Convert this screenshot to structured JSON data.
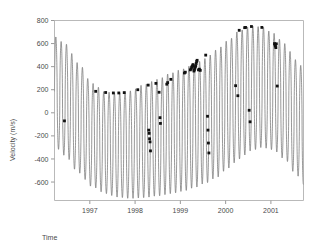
{
  "chart_data": {
    "type": "line",
    "title": "",
    "subtitle": "",
    "xlabel": "Time",
    "ylabel": "Velocity (m/s)",
    "xlim": [
      1996.22,
      2001.72
    ],
    "ylim": [
      -760,
      800
    ],
    "grid": false,
    "legend": null,
    "x_tick_labels": [
      "1997",
      "1998",
      "1999",
      "2000",
      "2001"
    ],
    "x_tick_values": [
      1997,
      1998,
      1999,
      2000,
      2001
    ],
    "y_tick_labels": [
      "800",
      "600",
      "400",
      "200",
      "0",
      "-200",
      "-400",
      "-600"
    ],
    "y_tick_values": [
      800,
      600,
      400,
      200,
      0,
      -200,
      -400,
      -600
    ],
    "series": [
      {
        "name": "model-velocity-curve",
        "kind": "line",
        "color": "#6b6b6b",
        "description": "High-frequency periodic radial velocity model with slowly varying envelope",
        "period_years": 0.1176,
        "envelope_upper_x": [
          1996.22,
          1996.45,
          1996.75,
          1997.05,
          1997.35,
          1997.6,
          1997.9,
          1998.2,
          1998.5,
          1998.8,
          1999.05,
          1999.3,
          1999.55,
          1999.8,
          2000.05,
          2000.3,
          2000.55,
          2000.8,
          2001.05,
          2001.3,
          2001.55,
          2001.72
        ],
        "envelope_upper_y": [
          660,
          600,
          430,
          255,
          180,
          172,
          190,
          245,
          290,
          345,
          380,
          420,
          470,
          545,
          625,
          710,
          752,
          745,
          690,
          600,
          460,
          390
        ],
        "envelope_lower_x": [
          1996.22,
          1996.45,
          1996.75,
          1997.05,
          1997.35,
          1997.6,
          1997.9,
          1998.2,
          1998.5,
          1998.8,
          1999.05,
          1999.3,
          1999.55,
          1999.8,
          2000.05,
          2000.3,
          2000.55,
          2000.8,
          2001.05,
          2001.3,
          2001.55,
          2001.72
        ],
        "envelope_lower_y": [
          -290,
          -370,
          -520,
          -640,
          -700,
          -730,
          -742,
          -735,
          -720,
          -700,
          -680,
          -650,
          -610,
          -560,
          -480,
          -400,
          -330,
          -300,
          -320,
          -400,
          -530,
          -620
        ]
      },
      {
        "name": "observed-data-points",
        "kind": "scatter",
        "color": "#111111",
        "marker": "square",
        "points": [
          {
            "x": 1996.44,
            "y": -70
          },
          {
            "x": 1997.13,
            "y": 186
          },
          {
            "x": 1997.35,
            "y": 176
          },
          {
            "x": 1997.52,
            "y": 172
          },
          {
            "x": 1997.64,
            "y": 172
          },
          {
            "x": 1997.76,
            "y": 175
          },
          {
            "x": 1998.06,
            "y": 200
          },
          {
            "x": 1998.29,
            "y": 240
          },
          {
            "x": 1998.3,
            "y": -150
          },
          {
            "x": 1998.31,
            "y": -178
          },
          {
            "x": 1998.32,
            "y": -225
          },
          {
            "x": 1998.33,
            "y": -252
          },
          {
            "x": 1998.34,
            "y": -330
          },
          {
            "x": 1998.46,
            "y": 255
          },
          {
            "x": 1998.53,
            "y": 178
          },
          {
            "x": 1998.55,
            "y": -42
          },
          {
            "x": 1998.56,
            "y": -92
          },
          {
            "x": 1998.7,
            "y": 248
          },
          {
            "x": 1998.72,
            "y": 262
          },
          {
            "x": 1998.79,
            "y": 290
          },
          {
            "x": 1999.09,
            "y": 345
          },
          {
            "x": 1999.11,
            "y": 352
          },
          {
            "x": 1999.22,
            "y": 372
          },
          {
            "x": 1999.24,
            "y": 380
          },
          {
            "x": 1999.25,
            "y": 395
          },
          {
            "x": 1999.26,
            "y": 400
          },
          {
            "x": 1999.27,
            "y": 408
          },
          {
            "x": 1999.28,
            "y": 418
          },
          {
            "x": 1999.3,
            "y": 362
          },
          {
            "x": 1999.31,
            "y": 372
          },
          {
            "x": 1999.32,
            "y": 386
          },
          {
            "x": 1999.33,
            "y": 398
          },
          {
            "x": 1999.34,
            "y": 408
          },
          {
            "x": 1999.35,
            "y": 428
          },
          {
            "x": 1999.36,
            "y": 445
          },
          {
            "x": 1999.37,
            "y": 455
          },
          {
            "x": 1999.4,
            "y": 372
          },
          {
            "x": 1999.42,
            "y": 378
          },
          {
            "x": 1999.44,
            "y": 368
          },
          {
            "x": 1999.56,
            "y": 500
          },
          {
            "x": 1999.6,
            "y": -30
          },
          {
            "x": 1999.61,
            "y": -150
          },
          {
            "x": 1999.62,
            "y": -262
          },
          {
            "x": 1999.63,
            "y": -348
          },
          {
            "x": 2000.22,
            "y": 235
          },
          {
            "x": 2000.27,
            "y": 148
          },
          {
            "x": 2000.3,
            "y": 715
          },
          {
            "x": 2000.42,
            "y": 738
          },
          {
            "x": 2000.44,
            "y": 740
          },
          {
            "x": 2000.52,
            "y": 22
          },
          {
            "x": 2000.54,
            "y": -78
          },
          {
            "x": 2000.57,
            "y": 748
          },
          {
            "x": 2000.8,
            "y": 740
          },
          {
            "x": 2001.08,
            "y": 600
          },
          {
            "x": 2001.09,
            "y": 588
          },
          {
            "x": 2001.1,
            "y": 578
          },
          {
            "x": 2001.11,
            "y": 565
          },
          {
            "x": 2001.12,
            "y": 598
          },
          {
            "x": 2001.14,
            "y": 232
          }
        ]
      }
    ]
  },
  "axes": {
    "x_axis_name": "time-axis",
    "y_axis_name": "velocity-axis"
  }
}
